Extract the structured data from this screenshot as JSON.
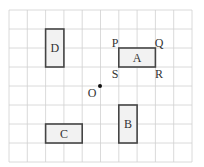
{
  "diagram": {
    "type": "grid-transformation",
    "grid": {
      "columns": 10,
      "rows": 8,
      "left": 9,
      "top": 10,
      "cell_w": 18.3,
      "cell_h": 19,
      "line_color": "#d0d0d0"
    },
    "shape_style": {
      "fill": "#f2f2f2",
      "stroke": "#444444"
    },
    "shapes": [
      {
        "name": "A",
        "label": "A",
        "col": 6,
        "row": 2,
        "w": 2,
        "h": 1
      },
      {
        "name": "B",
        "label": "B",
        "col": 6,
        "row": 5,
        "w": 1,
        "h": 2
      },
      {
        "name": "C",
        "label": "C",
        "col": 2,
        "row": 6,
        "w": 2,
        "h": 1
      },
      {
        "name": "D",
        "label": "D",
        "col": 2,
        "row": 1,
        "w": 1,
        "h": 2
      }
    ],
    "vertex_labels": [
      {
        "label": "P",
        "x": 115,
        "y": 47
      },
      {
        "label": "Q",
        "x": 159,
        "y": 47
      },
      {
        "label": "S",
        "x": 115,
        "y": 78
      },
      {
        "label": "R",
        "x": 159,
        "y": 78
      }
    ],
    "point": {
      "label": "O",
      "x": 100,
      "y": 86,
      "label_x": 92,
      "label_y": 97
    }
  }
}
